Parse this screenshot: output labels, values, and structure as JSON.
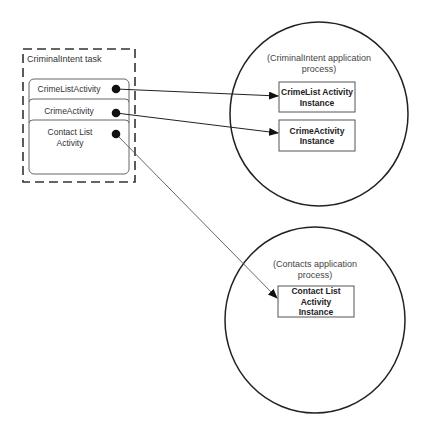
{
  "task": {
    "title": "CriminalIntent task",
    "activities": [
      {
        "label": "CrimeListActivity"
      },
      {
        "label": "CrimeActivity"
      },
      {
        "label": "Contact List Activity"
      }
    ]
  },
  "processes": [
    {
      "label": "(CriminalIntent application process)",
      "instances": [
        {
          "label": "CrimeList Activity Instance"
        },
        {
          "label": "CrimeActivity Instance"
        }
      ]
    },
    {
      "label": "(Contacts application process)",
      "instances": [
        {
          "label": "Contact List Activity Instance"
        }
      ]
    }
  ],
  "arrows": [
    {
      "from": "CrimeListActivity",
      "to": "CrimeList Activity Instance"
    },
    {
      "from": "CrimeActivity",
      "to": "CrimeActivity Instance"
    },
    {
      "from": "Contact List Activity",
      "to": "Contact List Activity Instance"
    }
  ],
  "colors": {
    "stroke": "#222222",
    "text": "#333333",
    "background": "#ffffff"
  }
}
